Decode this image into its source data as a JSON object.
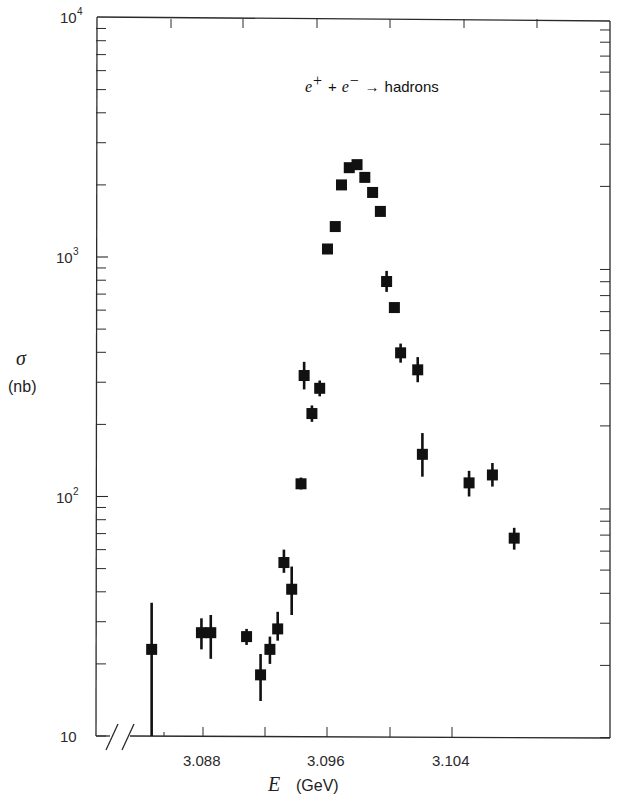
{
  "chart_data": {
    "type": "scatter",
    "title_parts": {
      "lhs1": "e",
      "sup1": "+",
      "plus": "+",
      "lhs2": "e",
      "sup2": "−",
      "arrow": "→",
      "rhs": "hadrons"
    },
    "xlabel": "E  (GeV)",
    "xlabel_parts": {
      "symbol": "E",
      "unit": "(GeV)"
    },
    "ylabel": "σ (nb)",
    "ylabel_parts": {
      "symbol": "σ",
      "unit": "(nb)"
    },
    "xscale": "linear",
    "yscale": "log",
    "xlim": [
      3.0828,
      3.1081
    ],
    "ylim": [
      10,
      10000
    ],
    "axis_break": "x-axis break near left edge (//)",
    "grid": false,
    "legend": null,
    "x_ticks": [
      3.088,
      3.096,
      3.104
    ],
    "x_tick_labels": [
      "3.088",
      "3.096",
      "3.104"
    ],
    "x_minor_ticks": [
      3.092,
      3.1
    ],
    "y_ticks": [
      10,
      100,
      1000,
      10000
    ],
    "y_tick_labels": [
      {
        "base": "10",
        "exp": ""
      },
      {
        "base": "10",
        "exp": "2"
      },
      {
        "base": "10",
        "exp": "3"
      },
      {
        "base": "10",
        "exp": "4"
      }
    ],
    "series": [
      {
        "name": "e+e- → hadrons",
        "marker": "square",
        "color": "#111111",
        "points": [
          {
            "x": 3.0847,
            "y": 23,
            "err_lo": 10,
            "err_hi": 36
          },
          {
            "x": 3.0879,
            "y": 27,
            "err_lo": 23,
            "err_hi": 31
          },
          {
            "x": 3.0885,
            "y": 27,
            "err_lo": 21,
            "err_hi": 32
          },
          {
            "x": 3.0908,
            "y": 26,
            "err_lo": 24,
            "err_hi": 28
          },
          {
            "x": 3.0917,
            "y": 18,
            "err_lo": 14,
            "err_hi": 22
          },
          {
            "x": 3.0923,
            "y": 23,
            "err_lo": 20,
            "err_hi": 26
          },
          {
            "x": 3.0928,
            "y": 28,
            "err_lo": 25,
            "err_hi": 33
          },
          {
            "x": 3.0932,
            "y": 53,
            "err_lo": 48,
            "err_hi": 60
          },
          {
            "x": 3.0937,
            "y": 41,
            "err_lo": 32,
            "err_hi": 51
          },
          {
            "x": 3.0943,
            "y": 113,
            "err_lo": 107,
            "err_hi": 120
          },
          {
            "x": 3.0945,
            "y": 320,
            "err_lo": 280,
            "err_hi": 365
          },
          {
            "x": 3.095,
            "y": 222,
            "err_lo": 205,
            "err_hi": 240
          },
          {
            "x": 3.0955,
            "y": 283,
            "err_lo": 262,
            "err_hi": 305
          },
          {
            "x": 3.096,
            "y": 1080
          },
          {
            "x": 3.0965,
            "y": 1340
          },
          {
            "x": 3.0969,
            "y": 2000
          },
          {
            "x": 3.0974,
            "y": 2360
          },
          {
            "x": 3.0979,
            "y": 2430
          },
          {
            "x": 3.0984,
            "y": 2150
          },
          {
            "x": 3.0989,
            "y": 1860
          },
          {
            "x": 3.0994,
            "y": 1550
          },
          {
            "x": 3.0998,
            "y": 790,
            "err_lo": 715,
            "err_hi": 875
          },
          {
            "x": 3.1003,
            "y": 615
          },
          {
            "x": 3.1007,
            "y": 398,
            "err_lo": 362,
            "err_hi": 435
          },
          {
            "x": 3.1018,
            "y": 338,
            "err_lo": 300,
            "err_hi": 382
          },
          {
            "x": 3.1021,
            "y": 150,
            "err_lo": 121,
            "err_hi": 184
          },
          {
            "x": 3.1051,
            "y": 114,
            "err_lo": 100,
            "err_hi": 128
          },
          {
            "x": 3.1066,
            "y": 123,
            "err_lo": 110,
            "err_hi": 138
          },
          {
            "x": 3.108,
            "y": 67,
            "err_lo": 60,
            "err_hi": 74
          }
        ]
      }
    ]
  },
  "layout_px": {
    "plot_left": 97,
    "plot_right": 610,
    "plot_top": 17,
    "plot_bottom": 736,
    "x0_val": 3.088,
    "x0_px": 203,
    "px_per_mev": 15.56,
    "y_decade_px": 239.5,
    "top_ticks_px": [
      171,
      243,
      317,
      390,
      464,
      537
    ],
    "bottom_ticks_px": [
      203,
      265,
      327,
      390,
      452
    ],
    "break_px": [
      112,
      128
    ],
    "first_data_axis_px": 164
  }
}
